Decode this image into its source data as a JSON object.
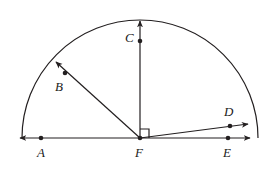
{
  "figure": {
    "type": "geometry-diagram",
    "stroke_color": "#231f20",
    "background_color": "#ffffff",
    "stroke_width": 1.2,
    "arc": {
      "center": {
        "x": 140,
        "y": 138
      },
      "radius": 118,
      "start_angle_deg": 0,
      "end_angle_deg": 180,
      "label": "semicircular-arc"
    },
    "baseline": {
      "label": "horizontal-line-AFE",
      "y": 138,
      "x_start": 20,
      "x_end": 250,
      "arrow_left": true,
      "arrow_right": true
    },
    "right_angle_marker": {
      "label": "right-angle-at-F",
      "vertex": {
        "x": 140,
        "y": 138
      },
      "size": 9,
      "between": [
        "ray-FC",
        "ray-FE"
      ]
    },
    "rays": [
      {
        "name": "ray-FB",
        "from": {
          "x": 140,
          "y": 138
        },
        "to": {
          "x": 56,
          "y": 62
        },
        "angle_deg": 138,
        "arrow": true
      },
      {
        "name": "ray-FC",
        "from": {
          "x": 140,
          "y": 138
        },
        "to": {
          "x": 140,
          "y": 21
        },
        "angle_deg": 90,
        "arrow": true
      },
      {
        "name": "ray-FD",
        "from": {
          "x": 140,
          "y": 138
        },
        "to": {
          "x": 248,
          "y": 124
        },
        "angle_deg": 7,
        "arrow": true
      }
    ],
    "points": [
      {
        "id": "A",
        "label": "A",
        "dot": {
          "x": 41,
          "y": 138
        },
        "label_pos": {
          "x": 37,
          "y": 146
        }
      },
      {
        "id": "B",
        "label": "B",
        "dot": {
          "x": 65,
          "y": 73
        },
        "label_pos": {
          "x": 55,
          "y": 80
        }
      },
      {
        "id": "C",
        "label": "C",
        "dot": {
          "x": 140,
          "y": 41
        },
        "label_pos": {
          "x": 125,
          "y": 31
        }
      },
      {
        "id": "D",
        "label": "D",
        "dot": {
          "x": 230,
          "y": 126
        },
        "label_pos": {
          "x": 224,
          "y": 105
        }
      },
      {
        "id": "E",
        "label": "E",
        "dot": {
          "x": 228,
          "y": 138
        },
        "label_pos": {
          "x": 223,
          "y": 146
        }
      },
      {
        "id": "F",
        "label": "F",
        "dot": {
          "x": 140,
          "y": 138
        },
        "label_pos": {
          "x": 135,
          "y": 146
        }
      }
    ]
  }
}
